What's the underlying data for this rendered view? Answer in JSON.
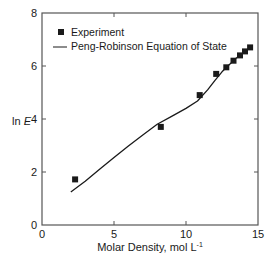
{
  "chart_data": {
    "type": "scatter",
    "title": "",
    "xlabel": "Molar Density, mol L",
    "xlabel_superscript": "-1",
    "ylabel_prefix": "ln ",
    "ylabel_italic": "E",
    "xlim": [
      0,
      15
    ],
    "ylim": [
      0,
      8
    ],
    "xticks": [
      0,
      5,
      10,
      15
    ],
    "yticks": [
      0,
      2,
      4,
      6,
      8
    ],
    "grid": false,
    "legend_position": "upper left",
    "series": [
      {
        "name": "Experiment",
        "kind": "markers",
        "marker": "square",
        "x": [
          2.3,
          8.25,
          10.95,
          12.1,
          12.8,
          13.3,
          13.75,
          14.1,
          14.45
        ],
        "y": [
          1.72,
          3.7,
          4.9,
          5.7,
          5.95,
          6.2,
          6.4,
          6.55,
          6.7
        ]
      },
      {
        "name": "Peng-Robinson Equation of State",
        "kind": "line",
        "x": [
          2.0,
          3.0,
          4.0,
          5.0,
          6.0,
          7.0,
          8.0,
          9.0,
          10.0,
          10.8,
          11.5,
          12.0,
          12.5,
          13.0,
          13.5,
          14.0,
          14.5
        ],
        "y": [
          1.25,
          1.65,
          2.1,
          2.55,
          2.98,
          3.4,
          3.8,
          4.1,
          4.4,
          4.68,
          5.1,
          5.45,
          5.78,
          6.05,
          6.3,
          6.5,
          6.72
        ]
      }
    ]
  },
  "colors": {
    "ink": "#1a1a1a",
    "axis": "#555555",
    "background": "#ffffff"
  },
  "legend": {
    "items": [
      {
        "label": "Experiment",
        "symbol": "square-marker"
      },
      {
        "label": "Peng-Robinson Equation of State",
        "symbol": "line"
      }
    ]
  }
}
